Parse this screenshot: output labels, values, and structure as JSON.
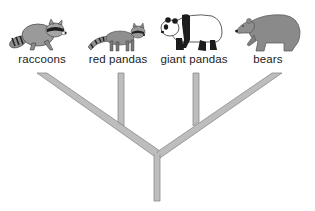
{
  "diagram": {
    "type": "phylogenetic-tree",
    "taxa": [
      {
        "label": "raccoons",
        "icon": "raccoon-icon"
      },
      {
        "label": "red pandas",
        "icon": "red-panda-icon"
      },
      {
        "label": "giant pandas",
        "icon": "giant-panda-icon"
      },
      {
        "label": "bears",
        "icon": "bear-icon"
      }
    ],
    "structure": "((raccoons, red pandas), (giant pandas, bears))",
    "colors": {
      "branch_fill": "#bdbdbd",
      "branch_stroke": "#8c8c8c",
      "animal_gray": "#8f8f8f",
      "animal_dark": "#2a2a2a",
      "label_text": "#222222"
    }
  }
}
